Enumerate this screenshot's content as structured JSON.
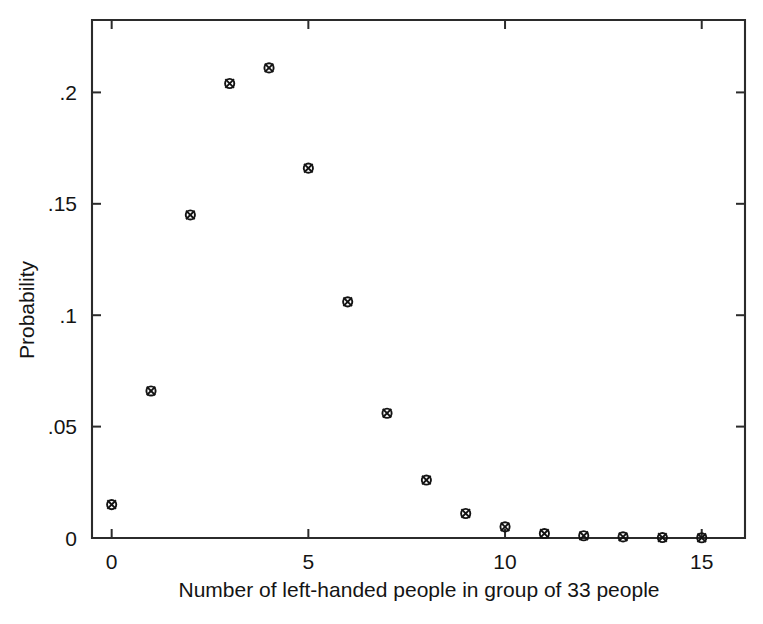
{
  "chart_data": {
    "type": "scatter",
    "title": "",
    "subtitle": "",
    "xlabel": "Number of left-handed people in group of 33 people",
    "ylabel": "Probability",
    "grid": false,
    "legend": "none",
    "xlim": [
      -0.5,
      16.1
    ],
    "ylim": [
      0,
      0.2325
    ],
    "xticks": [
      0,
      5,
      10,
      15
    ],
    "xticklabels": [
      "0",
      "5",
      "10",
      "15"
    ],
    "yticks": [
      0,
      0.05,
      0.1,
      0.15,
      0.2
    ],
    "yticklabels": [
      "0",
      ".05",
      ".1",
      ".15",
      ".2"
    ],
    "marker_style": "circle-with-x",
    "series": [
      {
        "name": "Probability",
        "x": [
          0,
          1,
          2,
          3,
          4,
          5,
          6,
          7,
          8,
          9,
          10,
          11,
          12,
          13,
          14,
          15
        ],
        "values": [
          0.015,
          0.066,
          0.145,
          0.204,
          0.211,
          0.166,
          0.106,
          0.056,
          0.026,
          0.011,
          0.005,
          0.002,
          0.001,
          0.0005,
          0.0002,
          0.0001
        ]
      }
    ],
    "annotations": []
  },
  "figure": {
    "background_color": "#ffffff",
    "ink_color": "#141414"
  }
}
